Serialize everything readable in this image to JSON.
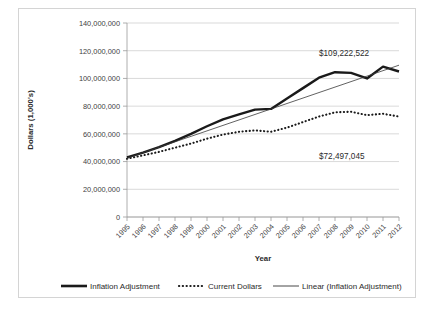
{
  "chart_data": {
    "type": "line",
    "title": "",
    "xlabel": "Year",
    "ylabel": "Dollars (1,000's)",
    "categories": [
      "1995",
      "1996",
      "1997",
      "1998",
      "1999",
      "2000",
      "2001",
      "2002",
      "2003",
      "2004",
      "2005",
      "2006",
      "2007",
      "2008",
      "2009",
      "2010",
      "2011",
      "2012"
    ],
    "ylim": [
      0,
      140000000
    ],
    "ytick_values": [
      0,
      20000000,
      40000000,
      60000000,
      80000000,
      100000000,
      120000000,
      140000000
    ],
    "ytick_labels": [
      "0",
      "20,000,000",
      "40,000,000",
      "60,000,000",
      "80,000,000",
      "100,000,000",
      "120,000,000",
      "140,000,000"
    ],
    "grid": true,
    "legend_position": "bottom",
    "series": [
      {
        "name": "Inflation Adjustment",
        "style": "solid-thick",
        "color": "#1a1a1a",
        "values": [
          43000000,
          46500000,
          50500000,
          55000000,
          60000000,
          65500000,
          70500000,
          74000000,
          77500000,
          78000000,
          85500000,
          93000000,
          100500000,
          104500000,
          104000000,
          100000000,
          108500000,
          105000000
        ]
      },
      {
        "name": "Current Dollars",
        "style": "dotted",
        "color": "#1a1a1a",
        "values": [
          42000000,
          44500000,
          47000000,
          50000000,
          53000000,
          56500000,
          59500000,
          61500000,
          62500000,
          61500000,
          64500000,
          68500000,
          72500000,
          75500000,
          76000000,
          73500000,
          74500000,
          72497045
        ]
      },
      {
        "name": "Linear (Inflation Adjustment)",
        "style": "solid-thin",
        "color": "#3a3a3a",
        "values": [
          42400000,
          46350000,
          50300000,
          54250000,
          58200000,
          62150000,
          66100000,
          70050000,
          74000000,
          77950000,
          81900000,
          85850000,
          89800000,
          93750000,
          97700000,
          101650000,
          105600000,
          109550000
        ]
      }
    ],
    "annotations": [
      {
        "text": "$109,222,522",
        "series": "Inflation Adjustment"
      },
      {
        "text": "$72,497,045",
        "series": "Current Dollars"
      }
    ]
  },
  "legend": {
    "items": [
      {
        "label": "Inflation Adjustment",
        "marker": "solid-thick"
      },
      {
        "label": "Current Dollars",
        "marker": "dotted"
      },
      {
        "label": "Linear (Inflation Adjustment)",
        "marker": "solid-thin"
      }
    ]
  }
}
